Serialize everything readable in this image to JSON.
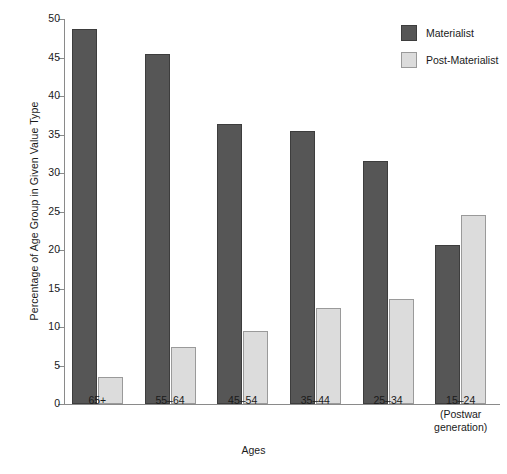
{
  "chart_data": {
    "type": "bar",
    "title": "",
    "xlabel": "Ages",
    "ylabel": "Percentage of Age Group in Given Value Type",
    "categories": [
      "65+",
      "55–64",
      "45–54",
      "35–44",
      "25–34",
      "15–24\n(Postwar\ngeneration)"
    ],
    "series": [
      {
        "name": "Materialist",
        "color": "#565656",
        "values": [
          48.7,
          45.5,
          36.4,
          35.4,
          31.5,
          20.6
        ]
      },
      {
        "name": "Post-Materialist",
        "color": "#dcdcdc",
        "values": [
          3.5,
          7.4,
          9.5,
          12.5,
          13.6,
          24.6
        ]
      }
    ],
    "ylim": [
      0,
      50
    ],
    "yticks": [
      0,
      5,
      10,
      15,
      20,
      25,
      30,
      35,
      40,
      45,
      50
    ],
    "ytick_labels": [
      "0",
      "5",
      "10",
      "15",
      "20",
      "25",
      "30",
      "35",
      "40",
      "45",
      "50"
    ],
    "grid": false,
    "legend_position": "top-right"
  },
  "legend": {
    "entries": [
      {
        "label": "Materialist",
        "swatch": "materialist"
      },
      {
        "label": "Post-Materialist",
        "swatch": "postmaterialist"
      }
    ]
  },
  "axes": {
    "x_title": "Ages",
    "y_title": "Percentage of Age Group in Given Value Type"
  }
}
